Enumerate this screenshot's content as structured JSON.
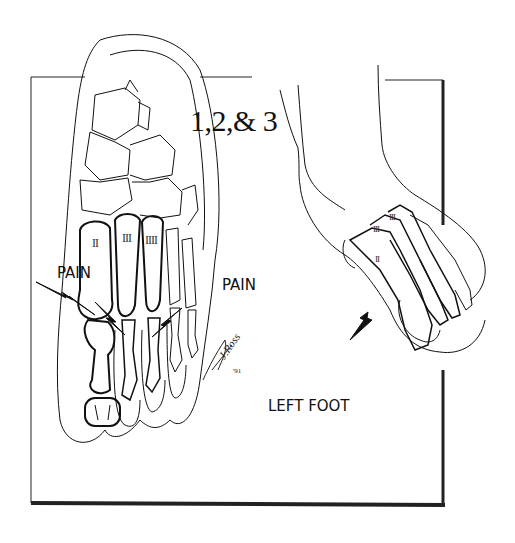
{
  "figure": {
    "title": "1,2,& 3",
    "pain_label_left": "PAIN",
    "pain_label_right": "PAIN",
    "caption": "LEFT FOOT",
    "left_foot_metatarsal_labels": [
      "II",
      "III",
      "IIII"
    ],
    "right_foot_metatarsal_labels": [
      "III",
      "III",
      "II"
    ],
    "signature": "J.Ross",
    "signature_year": "'91"
  },
  "colors": {
    "ink": "#111111",
    "background": "#ffffff"
  }
}
